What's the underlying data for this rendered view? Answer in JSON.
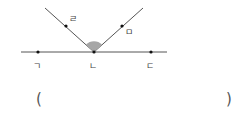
{
  "diagram": {
    "lines": {
      "horizontal": {
        "x1": 21,
        "y1": 52,
        "x2": 167,
        "y2": 52
      },
      "ray_left": {
        "x1": 94,
        "y1": 52,
        "x2": 45,
        "y2": 8
      },
      "ray_right": {
        "x1": 94,
        "y1": 52,
        "x2": 143,
        "y2": 8
      }
    },
    "points": [
      {
        "label": "ㄱ",
        "x": 38,
        "y": 52
      },
      {
        "label": "ㄴ",
        "x": 94,
        "y": 52
      },
      {
        "label": "ㄷ",
        "x": 151,
        "y": 52
      },
      {
        "label": "ㄹ",
        "x": 66,
        "y": 26
      },
      {
        "label": "ㅁ",
        "x": 122,
        "y": 26
      }
    ],
    "marked_angle": {
      "vertex": "ㄴ",
      "between": [
        "ㄹ",
        "ㅁ"
      ],
      "color": "#a6a6a6"
    },
    "line_color": "#555555"
  },
  "answer": {
    "open_paren": "(",
    "close_paren": ")",
    "value": ""
  }
}
